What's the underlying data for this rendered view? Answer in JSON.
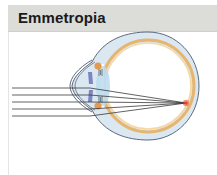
{
  "header": {
    "title": "Emmetropia"
  },
  "diagram": {
    "ray_count": 5,
    "colors": {
      "header_bg": "#dcdcd8",
      "sclera": "#dbe7f1",
      "choroid": "#e8b56f",
      "retina": "#f3d9a8",
      "outline": "#4d5a6e",
      "lens": "#bcdcee",
      "iris": "#7c86c2",
      "ciliary": "#e39a4c",
      "ray": "#3a3a3a",
      "focal_point": "#e8402a"
    }
  }
}
